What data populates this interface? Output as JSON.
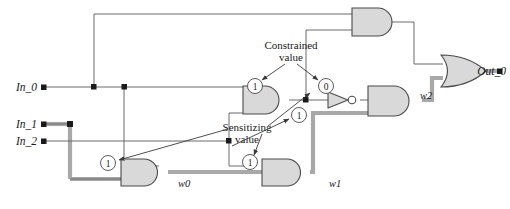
{
  "figure": {
    "type": "logic-circuit-diagram",
    "width": 510,
    "height": 209
  },
  "colors": {
    "wire": "#6b6b6b",
    "wire_dark": "#3a3a3a",
    "highlight_path": "#a8a8a8",
    "gate_fill": "#d9d9d9",
    "gate_stroke": "#4a4a4a",
    "text": "#1a1a1a",
    "background": "#ffffff"
  },
  "inputs": [
    {
      "id": "in0",
      "label": "In_0"
    },
    {
      "id": "in1",
      "label": "In_1"
    },
    {
      "id": "in2",
      "label": "In_2"
    }
  ],
  "outputs": [
    {
      "id": "out0",
      "label": "Out_0"
    }
  ],
  "wire_labels": [
    {
      "id": "w0",
      "label": "w0"
    },
    {
      "id": "w1",
      "label": "w1"
    },
    {
      "id": "w2",
      "label": "w2"
    }
  ],
  "annotations": [
    {
      "id": "constrained",
      "line1": "Constrained",
      "line2": "value"
    },
    {
      "id": "sensitizing",
      "line1": "Sensitizing",
      "line2": "value"
    }
  ],
  "value_markers": [
    {
      "id": "v-constrained-left",
      "value": "1"
    },
    {
      "id": "v-constrained-right",
      "value": "0"
    },
    {
      "id": "v-sensitize-and2",
      "value": "1"
    },
    {
      "id": "v-sensitize-and3",
      "value": "1"
    },
    {
      "id": "v-sensitize-and1",
      "value": "1"
    }
  ],
  "gates": [
    {
      "id": "and-top",
      "type": "AND",
      "label": ""
    },
    {
      "id": "and-mid-left",
      "type": "AND",
      "label": ""
    },
    {
      "id": "not-mid",
      "type": "NOT",
      "label": ""
    },
    {
      "id": "and-right",
      "type": "AND",
      "label": ""
    },
    {
      "id": "and-bottom-left",
      "type": "AND",
      "label": ""
    },
    {
      "id": "and-bottom-right",
      "type": "AND",
      "label": ""
    },
    {
      "id": "or-out",
      "type": "OR",
      "label": ""
    }
  ]
}
